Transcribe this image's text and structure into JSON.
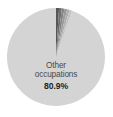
{
  "chart_data": {
    "type": "pie",
    "title": "",
    "subtitle": "",
    "xlabel": "",
    "ylabel": "",
    "legend": "none",
    "grid": false,
    "start_angle_deg": 0,
    "direction": "clockwise",
    "background_color": "#ffffff",
    "center": {
      "x": 56,
      "y": 57,
      "radius": 49
    },
    "labels": [
      "Other occupations",
      "Slice 2",
      "Slice 3",
      "Slice 4",
      "Slice 5",
      "Slice 6",
      "Slice 7"
    ],
    "categories": [
      "Other occupations",
      "Slice 2",
      "Slice 3",
      "Slice 4",
      "Slice 5",
      "Slice 6",
      "Slice 7"
    ],
    "values": [
      80.9,
      3.6,
      3.3,
      3.0,
      3.2,
      3.0,
      3.0
    ],
    "colors": [
      "#d4d4d4",
      "#555555",
      "#6e6e6e",
      "#848484",
      "#9a9a9a",
      "#aeaeae",
      "#c2c2c2"
    ],
    "slices": [
      {
        "name": "Other occupations",
        "value": 80.9,
        "value_text": "80.9%",
        "color": "#d4d4d4",
        "start_deg": 19.1,
        "end_deg": 360.0,
        "labeled": true
      },
      {
        "name": "Slice 2",
        "value": 3.6,
        "value_text": "",
        "color": "#555555",
        "start_deg": 0.0,
        "end_deg": 3.6,
        "labeled": false
      },
      {
        "name": "Slice 3",
        "value": 3.3,
        "value_text": "",
        "color": "#6e6e6e",
        "start_deg": 3.6,
        "end_deg": 6.9,
        "labeled": false
      },
      {
        "name": "Slice 4",
        "value": 3.0,
        "value_text": "",
        "color": "#848484",
        "start_deg": 6.9,
        "end_deg": 9.9,
        "labeled": false
      },
      {
        "name": "Slice 5",
        "value": 3.2,
        "value_text": "",
        "color": "#9a9a9a",
        "start_deg": 9.9,
        "end_deg": 13.1,
        "labeled": false
      },
      {
        "name": "Slice 6",
        "value": 3.0,
        "value_text": "",
        "color": "#aeaeae",
        "start_deg": 13.1,
        "end_deg": 16.1,
        "labeled": false
      },
      {
        "name": "Slice 7",
        "value": 3.0,
        "value_text": "",
        "color": "#c2c2c2",
        "start_deg": 16.1,
        "end_deg": 19.1,
        "labeled": false
      }
    ],
    "annotations": {
      "main_slice_label_line1": "Other",
      "main_slice_label_line2": "occupations",
      "main_slice_value": "80.9%"
    }
  }
}
